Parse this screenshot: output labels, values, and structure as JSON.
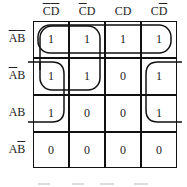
{
  "kmap": {
    "columns": [
      {
        "main": "CD",
        "overline": "both"
      },
      {
        "main": "CD",
        "overline": "C"
      },
      {
        "main": "CD",
        "overline": "none"
      },
      {
        "main": "CD",
        "overline": "D"
      }
    ],
    "col_labels": [
      "C̅D̅",
      "C̅D",
      "CD",
      "CD̅"
    ],
    "row_labels": [
      "A̅B̅",
      "A̅B",
      "AB",
      "AB̅"
    ],
    "cells": [
      [
        "1",
        "1",
        "1",
        "1"
      ],
      [
        "1",
        "1",
        "0",
        "1"
      ],
      [
        "1",
        "0",
        "0",
        "1"
      ],
      [
        "0",
        "0",
        "0",
        "0"
      ]
    ],
    "groups": [
      {
        "name": "top-row-group",
        "cells": "row 0, all columns"
      },
      {
        "name": "left-2x2-group",
        "cells": "rows 0-1, columns 0-1"
      },
      {
        "name": "wraparound-corner-group",
        "cells": "rows 1-2, columns 0 and 3"
      }
    ],
    "line_color": "#111111"
  }
}
